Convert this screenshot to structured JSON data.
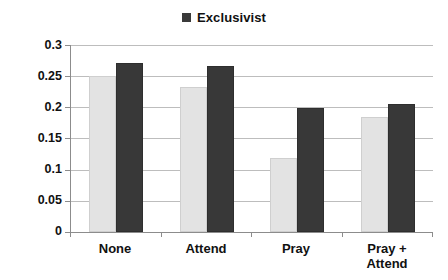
{
  "chart_data": {
    "type": "bar",
    "title": "",
    "xlabel": "",
    "ylabel": "Proportion blaming other religions (0-1)",
    "ylim": [
      0,
      0.3
    ],
    "ytick_labels": [
      "0.3",
      "0.25",
      "0.2",
      "0.15",
      "0.1",
      "0.05",
      "0"
    ],
    "ytick_values": [
      0.3,
      0.25,
      0.2,
      0.15,
      0.1,
      0.05,
      0
    ],
    "grid": true,
    "legend_position": "top-center",
    "categories": [
      "None",
      "Attend",
      "Pray",
      "Pray + Attend"
    ],
    "series": [
      {
        "name": "",
        "color": "#e3e3e3",
        "legend_shown": false,
        "values": [
          0.25,
          0.233,
          0.118,
          0.185
        ]
      },
      {
        "name": "Exclusivist",
        "color": "#383838",
        "legend_shown": true,
        "values": [
          0.271,
          0.267,
          0.199,
          0.206
        ]
      }
    ]
  },
  "legend": {
    "entries": [
      {
        "label": "Exclusivist",
        "swatch_color": "#383838"
      }
    ]
  },
  "axes": {
    "y_title": "Proportion blaming other religions (0-1)"
  }
}
